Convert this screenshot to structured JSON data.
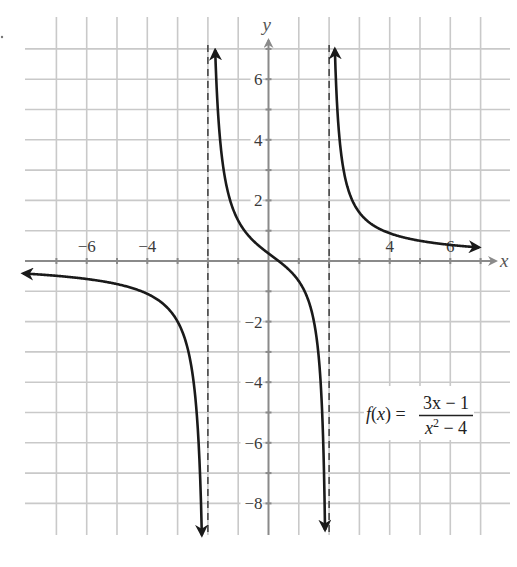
{
  "chart_data": {
    "type": "line",
    "title": "",
    "function": {
      "label_lhs": "f(x) =",
      "numerator": "3x − 1",
      "denominator_base": "x",
      "denominator_exp": "2",
      "denominator_rest": " − 4",
      "expression": "(3x - 1)/(x^2 - 4)"
    },
    "xlabel": "x",
    "ylabel": "y",
    "xlim": [
      -7.5,
      7.5
    ],
    "ylim": [
      -9,
      7.5
    ],
    "grid": true,
    "grid_step": 1,
    "x_ticks": [
      -6,
      -4,
      4,
      6
    ],
    "x_tick_labels": [
      "−6",
      "−4",
      "4",
      "6"
    ],
    "y_ticks": [
      6,
      4,
      2,
      -2,
      -4,
      -6,
      -8
    ],
    "y_tick_labels": [
      "6",
      "4",
      "2",
      "−2",
      "−4",
      "−6",
      "−8"
    ],
    "vertical_asymptotes": [
      -2,
      2
    ],
    "horizontal_asymptote": 0,
    "branches": [
      {
        "name": "left",
        "x_from": -8.1,
        "x_to": -2.2,
        "arrow_start": true,
        "arrow_end": true
      },
      {
        "name": "middle",
        "x_from": -1.76,
        "x_to": 1.866,
        "arrow_start": true,
        "arrow_end": true
      },
      {
        "name": "right",
        "x_from": 2.19,
        "x_to": 6.95,
        "arrow_start": true,
        "arrow_end": true
      }
    ],
    "sample_points": [
      {
        "x": -7,
        "y": -0.489
      },
      {
        "x": -4,
        "y": -1.083
      },
      {
        "x": -3,
        "y": -2.0
      },
      {
        "x": -1,
        "y": 1.333
      },
      {
        "x": 0,
        "y": 0.25
      },
      {
        "x": 1,
        "y": -0.667
      },
      {
        "x": 3,
        "y": 1.6
      },
      {
        "x": 4,
        "y": 0.917
      },
      {
        "x": 6,
        "y": 0.531
      }
    ],
    "colors": {
      "grid": "#c9c9c9",
      "axis": "#8a8a8a",
      "curve": "#1a1a1a",
      "asymptote": "#333333"
    }
  },
  "layout": {
    "origin_px": [
      268.5,
      261
    ],
    "unit_px": 30.3,
    "grid_x_range": [
      -7,
      7
    ],
    "grid_y_range": [
      -9,
      7
    ]
  }
}
